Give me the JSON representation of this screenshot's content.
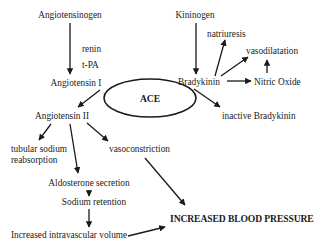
{
  "diagram": {
    "nodes": {
      "angiotensinogen": "Angiotensinogen",
      "renin": "renin",
      "tpa": "t-PA",
      "angiotensin_i": "Angiotensin I",
      "ace": "ACE",
      "angiotensin_ii": "Angiotensin II",
      "tubular_sodium": "tubular sodium\nreabsorption",
      "vasoconstriction": "vasoconstriction",
      "aldosterone": "Aldosterone secretion",
      "sodium_retention": "Sodium retention",
      "intravascular_volume": "Increased intravascular volume",
      "blood_pressure": "INCREASED BLOOD PRESSURE",
      "kininogen": "Kininogen",
      "natriuresis": "natriuresis",
      "vasodilatation": "vasodilatation",
      "bradykinin": "Bradykinin",
      "nitric_oxide": "Nitric Oxide",
      "inactive_bradykinin": "inactive Bradykinin"
    },
    "edges": [
      {
        "from": "angiotensinogen",
        "to": "angiotensin_i",
        "label": "renin / t-PA"
      },
      {
        "from": "angiotensin_i",
        "to": "angiotensin_ii",
        "via": "ACE"
      },
      {
        "from": "angiotensin_ii",
        "to": "tubular_sodium"
      },
      {
        "from": "angiotensin_ii",
        "to": "aldosterone"
      },
      {
        "from": "angiotensin_ii",
        "to": "vasoconstriction"
      },
      {
        "from": "aldosterone",
        "to": "sodium_retention"
      },
      {
        "from": "sodium_retention",
        "to": "intravascular_volume"
      },
      {
        "from": "intravascular_volume",
        "to": "blood_pressure"
      },
      {
        "from": "vasoconstriction",
        "to": "blood_pressure"
      },
      {
        "from": "kininogen",
        "to": "bradykinin"
      },
      {
        "from": "bradykinin",
        "to": "natriuresis"
      },
      {
        "from": "bradykinin",
        "to": "vasodilatation"
      },
      {
        "from": "bradykinin",
        "to": "nitric_oxide"
      },
      {
        "from": "nitric_oxide",
        "to": "vasodilatation"
      },
      {
        "from": "bradykinin",
        "to": "inactive_bradykinin",
        "via": "ACE"
      }
    ]
  },
  "colors": {
    "ink": "#1a1a1a",
    "background": "#ffffff"
  }
}
